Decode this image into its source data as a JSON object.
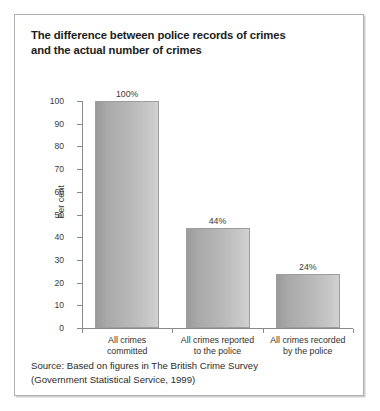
{
  "title": {
    "line1": "The difference between police records of crimes",
    "line2": "and the actual number of crimes"
  },
  "source": {
    "line1": "Source: Based on figures in The British Crime Survey",
    "line2": "(Government Statistical Service, 1999)"
  },
  "colors": {
    "frame": "#b0b0b0",
    "axis": "#8a8a8a",
    "bar_dark": "#9a9a9a",
    "bar_light": "#d2d2d2",
    "text": "#2b2b2b"
  },
  "chart_data": {
    "type": "bar",
    "title": "The difference between police records of crimes and the actual number of crimes",
    "xlabel": "",
    "ylabel": "Per cent",
    "ylim": [
      0,
      100
    ],
    "yticks": [
      0,
      10,
      20,
      30,
      40,
      50,
      60,
      70,
      80,
      90,
      100
    ],
    "grid": false,
    "legend": false,
    "categories": [
      "All crimes committed",
      "All crimes reported to the police",
      "All crimes recorded by the police"
    ],
    "category_lines": [
      [
        "All crimes",
        "committed"
      ],
      [
        "All crimes reported",
        "to the police"
      ],
      [
        "All crimes recorded",
        "by the police"
      ]
    ],
    "values": [
      100,
      44,
      24
    ],
    "data_labels": [
      "100%",
      "44%",
      "24%"
    ]
  }
}
